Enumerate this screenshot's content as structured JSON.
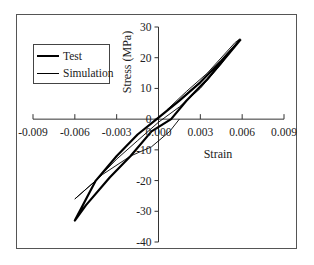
{
  "chart_data": {
    "type": "line",
    "title": "",
    "xlabel": "Strain",
    "ylabel": "Stress (MPa)",
    "xlim": [
      -0.009,
      0.009
    ],
    "ylim": [
      -40,
      30
    ],
    "x_ticks": [
      "-0.009",
      "-0.006",
      "-0.003",
      "0.000",
      "0.003",
      "0.006",
      "0.009"
    ],
    "y_ticks": [
      "30",
      "20",
      "10",
      "0",
      "-10",
      "-20",
      "-30",
      "-40"
    ],
    "grid": false,
    "legend_position": "upper-left",
    "series": [
      {
        "name": "Test",
        "style": "thick",
        "points": [
          [
            0.0059,
            26
          ],
          [
            0.0045,
            19
          ],
          [
            0.003,
            12
          ],
          [
            0.0015,
            6
          ],
          [
            0.0,
            0.5
          ],
          [
            -0.0015,
            -5
          ],
          [
            -0.003,
            -12
          ],
          [
            -0.0045,
            -20
          ],
          [
            -0.006,
            -33
          ],
          [
            -0.0052,
            -28
          ],
          [
            -0.0035,
            -19
          ],
          [
            -0.002,
            -12
          ],
          [
            -0.0005,
            -4
          ],
          [
            0.0009,
            0
          ],
          [
            0.002,
            6
          ],
          [
            0.0035,
            13
          ],
          [
            0.005,
            21
          ],
          [
            0.0059,
            26
          ]
        ]
      },
      {
        "name": "Simulation",
        "style": "thin",
        "points": [
          [
            0.0006,
            3
          ],
          [
            0.002,
            9
          ],
          [
            0.0035,
            15
          ],
          [
            0.0055,
            25
          ],
          [
            0.0058,
            26
          ],
          [
            0.0045,
            18
          ],
          [
            0.003,
            10
          ],
          [
            0.0015,
            4
          ],
          [
            0.0,
            -1
          ],
          [
            -0.0015,
            -7
          ],
          [
            -0.003,
            -13
          ],
          [
            -0.0045,
            -20
          ],
          [
            -0.006,
            -26
          ],
          [
            -0.004,
            -18
          ],
          [
            -0.002,
            -12
          ],
          [
            -0.0005,
            -9
          ],
          [
            0.0008,
            -4
          ],
          [
            0.0015,
            0
          ]
        ]
      }
    ]
  },
  "legend": {
    "items": [
      {
        "label": "Test"
      },
      {
        "label": "Simulation"
      }
    ]
  }
}
